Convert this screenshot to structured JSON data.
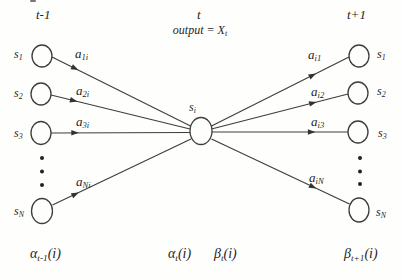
{
  "figure": {
    "time_labels": {
      "prev": "t-1",
      "current": "t",
      "next": "t+1"
    },
    "output_label": {
      "base": "output = X",
      "sub": "t"
    },
    "states": {
      "left": [
        {
          "base": "s",
          "sub": "1"
        },
        {
          "base": "s",
          "sub": "2"
        },
        {
          "base": "s",
          "sub": "3"
        },
        {
          "base": "s",
          "sub": "N"
        }
      ],
      "center": {
        "base": "s",
        "sub": "i"
      },
      "right": [
        {
          "base": "s",
          "sub": "1"
        },
        {
          "base": "s",
          "sub": "2"
        },
        {
          "base": "s",
          "sub": "3"
        },
        {
          "base": "s",
          "sub": "N"
        }
      ]
    },
    "transitions": {
      "incoming": [
        {
          "base": "a",
          "sub": "1i"
        },
        {
          "base": "a",
          "sub": "2i"
        },
        {
          "base": "a",
          "sub": "3i"
        },
        {
          "base": "a",
          "sub": "Ni"
        }
      ],
      "outgoing": [
        {
          "base": "a",
          "sub": "i1"
        },
        {
          "base": "a",
          "sub": "i2"
        },
        {
          "base": "a",
          "sub": "i3"
        },
        {
          "base": "a",
          "sub": "iN"
        }
      ]
    },
    "bottom_labels": [
      {
        "base": "α",
        "sub": "t-1",
        "suffix": "(i)"
      },
      {
        "base": "α",
        "sub": "t",
        "suffix": "(i)"
      },
      {
        "base": "β",
        "sub": "t",
        "suffix": "(i)"
      },
      {
        "base": "β",
        "sub": "t+1",
        "suffix": "(i)"
      }
    ],
    "colors": {
      "stroke": "#3d3d3d",
      "text": "#1f1f1f",
      "background": "#fefefc"
    }
  }
}
